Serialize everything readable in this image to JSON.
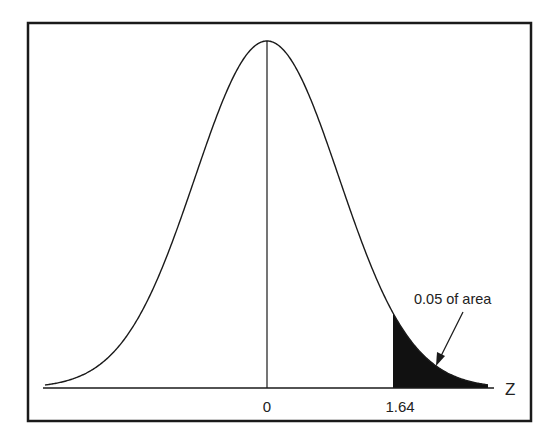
{
  "chart_data": {
    "type": "area",
    "title": "",
    "xlabel": "Z",
    "ylabel": "",
    "x_ticks": [
      {
        "value": 0,
        "label": "0"
      },
      {
        "value": 1.64,
        "label": "1.64"
      }
    ],
    "distribution": {
      "name": "normal",
      "mean": 0,
      "sd": 1
    },
    "shaded_region": {
      "from": 1.64,
      "to": "inf",
      "area": 0.05,
      "color": "#111111"
    },
    "annotations": [
      {
        "text": "0.05 of area",
        "points_to": "shaded_region"
      }
    ],
    "center_line": {
      "x": 0
    },
    "grid": false,
    "legend": "none",
    "frame": true
  },
  "labels": {
    "axis_name": "Z",
    "tick_zero": "0",
    "tick_crit": "1.64",
    "annotation": "0.05 of area"
  },
  "colors": {
    "line": "#1a1a1a",
    "shade": "#111111",
    "frame": "#1a1a1a",
    "background": "#ffffff"
  }
}
